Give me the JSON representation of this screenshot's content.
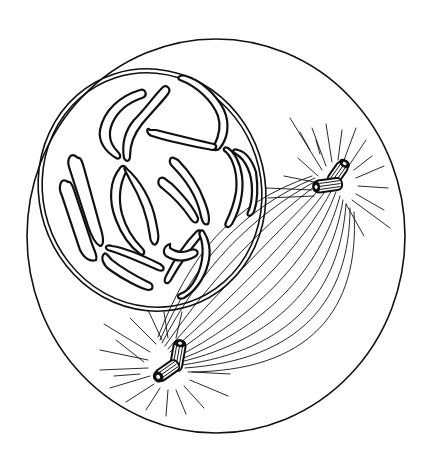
{
  "figure": {
    "style": "black ink line drawing on white background",
    "colors": {
      "ink": "#111111",
      "background": "#ffffff"
    },
    "elements": {
      "cell_membrane": "cell-membrane",
      "nuclear_envelope": "nuclear-envelope (double line)",
      "chromosomes": "condensed chromosomes inside nucleus",
      "centrioles": [
        "upper-right centriole pair",
        "lower centriole pair"
      ],
      "asters": "astral rays radiating from each centriole pair",
      "spindle": "spindle fibers arcing between the two centriole pairs"
    }
  }
}
